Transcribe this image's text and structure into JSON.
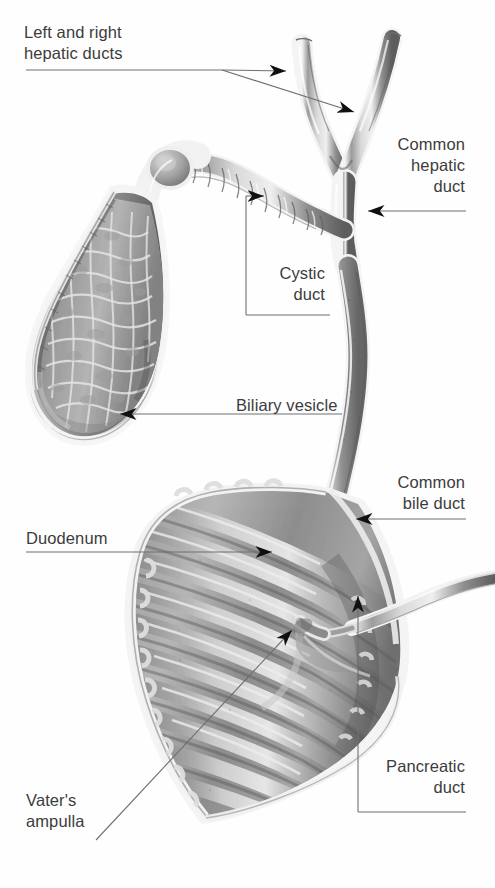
{
  "figure": {
    "style": "grayscale medical illustration",
    "background_color": "#ffffff",
    "label_color": "#3c3c3c",
    "leader_color": "#6b6b6b",
    "arrow_color": "#111111",
    "tissue_colors": {
      "light": "#e6e6e6",
      "mid": "#a8a8a8",
      "dark": "#6e6e6e",
      "shadow": "#4f4f4f",
      "outline": "#f2f2f2"
    }
  },
  "labels": [
    {
      "id": "left-right-hepatic-ducts",
      "text": "Left and right\nhepatic ducts",
      "align": "left",
      "x": 24,
      "y": 22,
      "width": 200
    },
    {
      "id": "common-hepatic-duct",
      "text": "Common\nhepatic\nduct",
      "align": "right",
      "x": 290,
      "y": 134,
      "width": 175
    },
    {
      "id": "cystic-duct",
      "text": "Cystic\nduct",
      "align": "right",
      "x": 190,
      "y": 263,
      "width": 135
    },
    {
      "id": "biliary-vesicle",
      "text": "Biliary vesicle",
      "align": "left",
      "x": 236,
      "y": 395,
      "width": 200
    },
    {
      "id": "common-bile-duct",
      "text": "Common\nbile duct",
      "align": "right",
      "x": 290,
      "y": 472,
      "width": 175
    },
    {
      "id": "duodenum",
      "text": "Duodenum",
      "align": "left",
      "x": 26,
      "y": 528,
      "width": 160
    },
    {
      "id": "pancreatic-duct",
      "text": "Pancreatic\nduct",
      "align": "right",
      "x": 300,
      "y": 756,
      "width": 165
    },
    {
      "id": "vaters-ampulla",
      "text": "Vater's\nampulla",
      "align": "left",
      "x": 26,
      "y": 790,
      "width": 160
    }
  ],
  "structures": [
    {
      "id": "gallbladder",
      "name": "Biliary vesicle (gallbladder)",
      "note": "cut-away showing honeycomb mucosa"
    },
    {
      "id": "cystic-duct",
      "name": "Cystic duct",
      "note": "spiral valves of Heister, beaded"
    },
    {
      "id": "right-hepatic-duct",
      "name": "Right hepatic duct",
      "note": "upper-left branch of Y"
    },
    {
      "id": "left-hepatic-duct",
      "name": "Left hepatic duct",
      "note": "upper-right branch of Y"
    },
    {
      "id": "common-hepatic-duct",
      "name": "Common hepatic duct",
      "note": "stem below bifurcation"
    },
    {
      "id": "common-bile-duct",
      "name": "Common bile duct",
      "note": "long sinuous duct to duodenum"
    },
    {
      "id": "pancreatic-duct",
      "name": "Pancreatic duct",
      "note": "enters from right, joins CBD"
    },
    {
      "id": "duodenum",
      "name": "Duodenum",
      "note": "cut-away, plicae circulares"
    },
    {
      "id": "vaters-ampulla",
      "name": "Ampulla of Vater",
      "note": "confluence at duodenal wall"
    }
  ]
}
